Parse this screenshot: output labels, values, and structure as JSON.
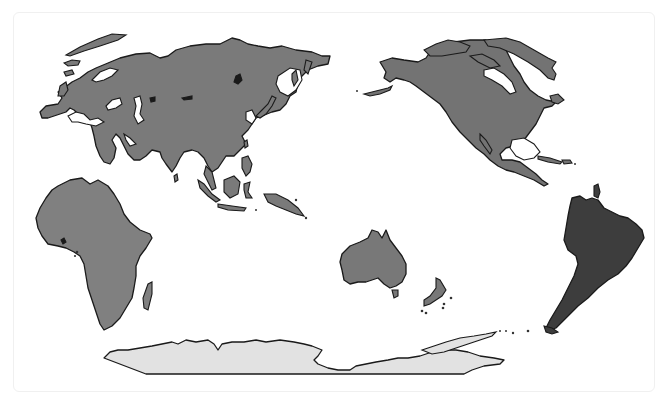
{
  "map": {
    "type": "world-continents",
    "projection": "pacific-centered",
    "colors": {
      "background": "#ffffff",
      "card_border": "#f0f0f0",
      "outline": "#1a1a1a",
      "eurasia": "#7a7a7a",
      "africa": "#808080",
      "north_america": "#737373",
      "south_america": "#3d3d3d",
      "australia": "#787878",
      "antarctica": "#e2e2e2"
    },
    "regions": [
      {
        "name": "Eurasia",
        "fill": "#7a7a7a"
      },
      {
        "name": "Africa",
        "fill": "#808080"
      },
      {
        "name": "North America",
        "fill": "#737373"
      },
      {
        "name": "South America",
        "fill": "#3d3d3d"
      },
      {
        "name": "Oceania",
        "fill": "#787878"
      },
      {
        "name": "Antarctica",
        "fill": "#e2e2e2"
      }
    ]
  }
}
